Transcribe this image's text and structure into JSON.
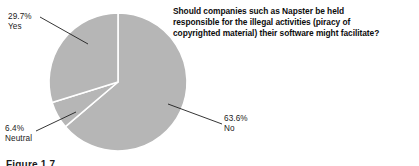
{
  "figure": {
    "caption": "Figure 1.7",
    "background_color": "#ffffff"
  },
  "chart_data": {
    "type": "pie",
    "title": "Should companies such as Napster be held responsible for the illegal activities (piracy of copyrighted material) their software might facilitate?",
    "title_lines": [
      "Should companies such as Napster be held",
      "responsible for the illegal activities (piracy of",
      "copyrighted material) their software might facilitate?"
    ],
    "categories": [
      "No",
      "Yes",
      "Neutral"
    ],
    "values": [
      63.6,
      29.7,
      6.4
    ],
    "value_suffix": "%",
    "slice_color": "#b6b6b6",
    "slice_border_color": "#ffffff",
    "leader_line_color": "#1f1f1f",
    "legend": "none",
    "grid": false,
    "slices": [
      {
        "name": "No",
        "value": 63.6,
        "percent_label": "63.6%",
        "category_label": "No",
        "color": "#b6b6b6",
        "start_angle_deg": 0,
        "end_angle_deg": 228.96
      },
      {
        "name": "Yes",
        "value": 29.7,
        "percent_label": "29.7%",
        "category_label": "Yes",
        "color": "#b6b6b6",
        "start_angle_deg": 253.0,
        "end_angle_deg": 360.0
      },
      {
        "name": "Neutral",
        "value": 6.4,
        "percent_label": "6.4%",
        "category_label": "Neutral",
        "color": "#b6b6b6",
        "start_angle_deg": 228.96,
        "end_angle_deg": 253.0
      }
    ]
  }
}
